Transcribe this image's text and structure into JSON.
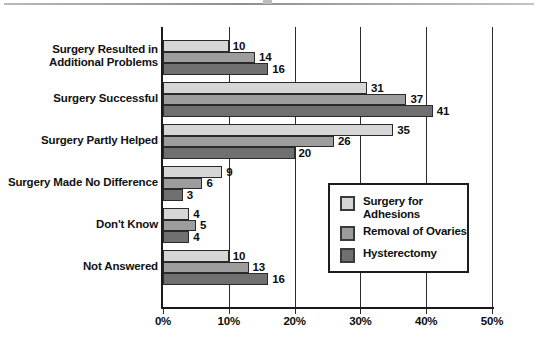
{
  "chart_data": {
    "type": "bar",
    "orientation": "horizontal",
    "title": "",
    "xlabel": "",
    "ylabel": "",
    "xlim": [
      0,
      50
    ],
    "xticks": [
      0,
      10,
      20,
      30,
      40,
      50
    ],
    "xtick_labels": [
      "0%",
      "10%",
      "20%",
      "30%",
      "40%",
      "50%"
    ],
    "grid": true,
    "legend_position": "inside-right-lower",
    "categories": [
      "Surgery Resulted in\nAdditional Problems",
      "Surgery Successful",
      "Surgery Partly Helped",
      "Surgery Made No Difference",
      "Don't Know",
      "Not Answered"
    ],
    "series": [
      {
        "name": "Surgery for\nAdhesions",
        "legend_label": "Surgery for\nAdhesions",
        "color": "#d6d6d6",
        "values": [
          10,
          31,
          35,
          9,
          4,
          10
        ]
      },
      {
        "name": "Removal of Ovaries",
        "legend_label": "Removal of Ovaries",
        "color": "#9d9d9d",
        "values": [
          14,
          37,
          26,
          6,
          5,
          13
        ]
      },
      {
        "name": "Hysterectomy",
        "legend_label": "Hysterectomy",
        "color": "#707070",
        "values": [
          16,
          41,
          20,
          3,
          4,
          16
        ]
      }
    ],
    "value_labels": [
      [
        "10",
        "14",
        "16"
      ],
      [
        "31",
        "37",
        "41"
      ],
      [
        "35",
        "26",
        "20"
      ],
      [
        "9",
        "6",
        "3"
      ],
      [
        "4",
        "5",
        "4"
      ],
      [
        "10",
        "13",
        "16"
      ]
    ]
  },
  "legend": {
    "items": [
      {
        "label": "Surgery for\nAdhesions",
        "color": "#d6d6d6"
      },
      {
        "label": "Removal of Ovaries",
        "color": "#9d9d9d"
      },
      {
        "label": "Hysterectomy",
        "color": "#707070"
      }
    ]
  },
  "axis": {
    "x_tick_labels": [
      "0%",
      "10%",
      "20%",
      "30%",
      "40%",
      "50%"
    ]
  }
}
